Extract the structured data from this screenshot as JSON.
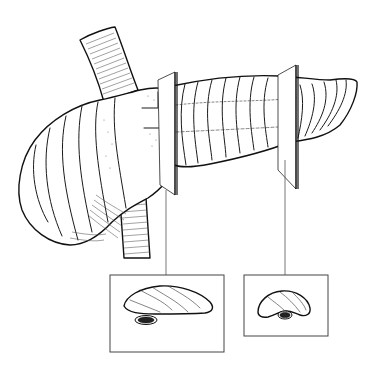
{
  "figure": {
    "subject": "Pancreas with two transverse cross-section planes",
    "colors": {
      "line": "#111111",
      "background": "#ffffff",
      "duct_lumen": "#222222",
      "leader_line": "#555555"
    },
    "parts": [
      {
        "id": "vessel",
        "description": "Tubular vessel passing behind pancreatic head"
      },
      {
        "id": "head",
        "description": "Pancreatic head (lobulated, stippled)"
      },
      {
        "id": "body",
        "description": "Pancreatic body"
      },
      {
        "id": "tail",
        "description": "Pancreatic tail"
      },
      {
        "id": "plane-1",
        "description": "Section plane through neck/body"
      },
      {
        "id": "plane-2",
        "description": "Section plane through distal body"
      }
    ],
    "insets": [
      {
        "id": "section-1",
        "description": "Cross-section at plane 1 showing duct below gland"
      },
      {
        "id": "section-2",
        "description": "Cross-section at plane 2 showing smaller gland with duct"
      }
    ]
  }
}
